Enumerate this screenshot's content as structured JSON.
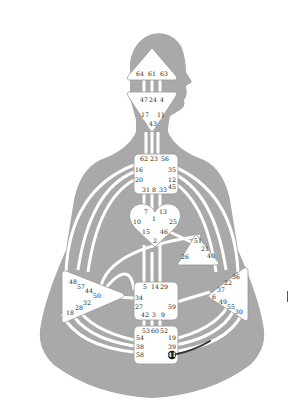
{
  "diagram": {
    "type": "human-design-bodygraph",
    "colors": {
      "body": "#a9a9a9",
      "center_fill": "#ffffff",
      "center_stroke": "#9a9a9a",
      "channel": "#ffffff",
      "active_gate": "#111111",
      "active_line": "#333333"
    },
    "centers": {
      "head": {
        "gates": [
          "64",
          "61",
          "63"
        ]
      },
      "ajna": {
        "gates": [
          "47",
          "24",
          "4",
          "17",
          "11",
          "43"
        ]
      },
      "throat": {
        "gates": [
          "62",
          "23",
          "56",
          "16",
          "35",
          "20",
          "12",
          "31",
          "8",
          "33",
          "45"
        ]
      },
      "g": {
        "gates": [
          "7",
          "13",
          "1",
          "10",
          "25",
          "15",
          "46",
          "2"
        ]
      },
      "ego": {
        "gates": [
          "51",
          "21",
          "26",
          "40"
        ]
      },
      "spleen": {
        "gates": [
          "48",
          "57",
          "44",
          "50",
          "32",
          "28",
          "18"
        ]
      },
      "solar_plexus": {
        "gates": [
          "36",
          "22",
          "37",
          "6",
          "49",
          "55",
          "30"
        ]
      },
      "sacral": {
        "gates": [
          "5",
          "14",
          "29",
          "34",
          "27",
          "59",
          "42",
          "3",
          "9"
        ]
      },
      "root": {
        "gates": [
          "53",
          "60",
          "52",
          "54",
          "19",
          "38",
          "39",
          "58",
          "41"
        ]
      }
    },
    "active_gate": "41"
  }
}
